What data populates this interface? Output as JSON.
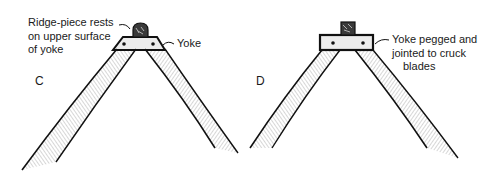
{
  "figures": [
    {
      "letter": "C",
      "labels": {
        "ridge_note": [
          "Ridge-piece rests",
          "on upper surface",
          "of yoke"
        ],
        "yoke": "Yoke"
      }
    },
    {
      "letter": "D",
      "labels": {
        "yoke_note": [
          "Yoke pegged and",
          "jointed to cruck",
          "blades"
        ]
      }
    }
  ],
  "colors": {
    "ink": "#111111",
    "hatch": "#8a8a8a",
    "background": "#ffffff"
  }
}
